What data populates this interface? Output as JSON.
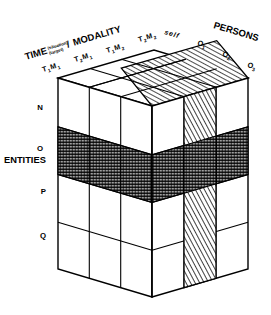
{
  "figure": {
    "type": "isometric-cube-diagram"
  },
  "axes": {
    "top_left": {
      "name": "time-modality-axis",
      "label_main": "TIME",
      "label_super": "(situation)",
      "label_sub": "(target)",
      "label_sep": "/",
      "label_second": "MODALITY",
      "ticks": [
        {
          "base": "T",
          "sub": "1",
          "base2": "M",
          "sub2": "1",
          "text": "T1M1"
        },
        {
          "base": "T",
          "sub": "2",
          "base2": "M",
          "sub2": "1",
          "text": "T2M1"
        },
        {
          "base": "T",
          "sub": "1",
          "base2": "M",
          "sub2": "2",
          "text": "T1M2"
        },
        {
          "base": "T",
          "sub": "2",
          "base2": "M",
          "sub2": "2",
          "text": "T2M2"
        }
      ]
    },
    "top_right": {
      "name": "persons-axis",
      "label": "PERSONS",
      "ticks": [
        {
          "text": "self",
          "base": "self",
          "sub": ""
        },
        {
          "text": "O1",
          "base": "O",
          "sub": "1"
        },
        {
          "text": "O2",
          "base": "O",
          "sub": "2"
        },
        {
          "text": "O3",
          "base": "O",
          "sub": "3"
        }
      ]
    },
    "left": {
      "name": "entities-axis",
      "label": "ENTITIES",
      "ticks": [
        {
          "text": "N"
        },
        {
          "text": "O"
        },
        {
          "text": "P"
        },
        {
          "text": "Q"
        }
      ]
    }
  },
  "highlights": [
    {
      "name": "cross-hatched-band",
      "description": "horizontal slab at ENTITIES row O wrapping both visible faces",
      "pattern": "cross-hatch",
      "row": "O"
    },
    {
      "name": "diagonal-hatched-slab",
      "description": "vertical slab at PERSONS = self / TIME column 3 running full height",
      "pattern": "diagonal-hatch",
      "column": "self"
    }
  ],
  "colors": {
    "stroke": "#000000",
    "face": "#ffffff",
    "hatch": "#000000",
    "background": "#ffffff"
  },
  "grid": {
    "left_face_cols": 3,
    "right_face_cols": 4,
    "rows": 4
  }
}
